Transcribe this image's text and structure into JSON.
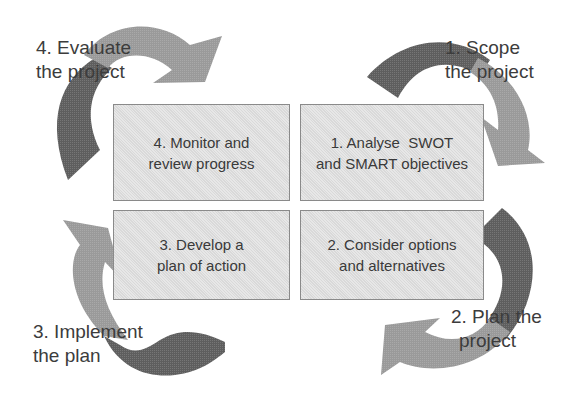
{
  "diagram": {
    "type": "cycle",
    "stages": [
      {
        "id": "stage-1",
        "label_line1": "1. Scope",
        "label_line2": "the project",
        "box_line1": "1. Analyse  SWOT",
        "box_line2": "and SMART objectives"
      },
      {
        "id": "stage-2",
        "label_line1": "2. Plan the",
        "label_line2": "project",
        "box_line1": "2. Consider options",
        "box_line2": "and alternatives"
      },
      {
        "id": "stage-3",
        "label_line1": "3. Implement",
        "label_line2": "the plan",
        "box_line1": "3. Develop a",
        "box_line2": "plan of action"
      },
      {
        "id": "stage-4",
        "label_line1": "4. Evaluate",
        "label_line2": "the project",
        "box_line1": "4. Monitor and",
        "box_line2": "review progress"
      }
    ],
    "colors": {
      "arrow_dark": "#5e5e5e",
      "arrow_light": "#9a9a9a",
      "box_fill": "#e2e2e2",
      "box_border": "#8a8a8a",
      "text": "#3a3a3a"
    }
  }
}
